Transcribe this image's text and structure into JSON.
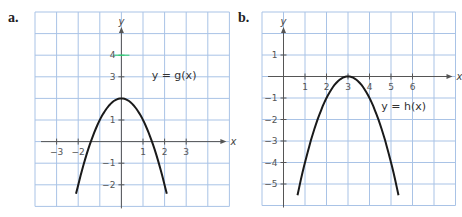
{
  "chart_data": [
    {
      "type": "line",
      "panel": "a.",
      "title": "",
      "function_label": "y = g(x)",
      "xlabel": "x",
      "ylabel": "y",
      "x_ticks": [
        -3,
        -2,
        1,
        2,
        3
      ],
      "x_tick_labels": [
        "−3",
        "−2",
        "1",
        "2",
        "3"
      ],
      "y_ticks": [
        4,
        3,
        1,
        -1,
        -2
      ],
      "y_tick_labels": [
        "4",
        "3",
        "1",
        "−1",
        "−2"
      ],
      "xlim": [
        -4,
        5
      ],
      "ylim": [
        -3,
        6
      ],
      "grid": true,
      "series": [
        {
          "name": "g(x)",
          "formula": "2 - x^2",
          "x": [
            -2.1,
            -2,
            -1.5,
            -1,
            -0.5,
            0,
            0.5,
            1,
            1.5,
            2,
            2.1
          ],
          "y": [
            -2.41,
            -2,
            -0.25,
            1,
            1.75,
            2,
            1.75,
            1,
            -0.25,
            -2,
            -2.41
          ]
        }
      ]
    },
    {
      "type": "line",
      "panel": "b.",
      "title": "",
      "function_label": "y = h(x)",
      "xlabel": "x",
      "ylabel": "y",
      "x_ticks": [
        1,
        2,
        3,
        4,
        5,
        6
      ],
      "x_tick_labels": [
        "1",
        "2",
        "3",
        "4",
        "5",
        "6"
      ],
      "y_ticks": [
        1,
        -1,
        -2,
        -3,
        -4,
        -5
      ],
      "y_tick_labels": [
        "1",
        "−1",
        "−2",
        "−3",
        "−4",
        "−5"
      ],
      "xlim": [
        -1,
        8
      ],
      "ylim": [
        -6,
        3
      ],
      "grid": true,
      "series": [
        {
          "name": "h(x)",
          "formula": "-(x - 3)^2",
          "x": [
            0.65,
            1,
            1.5,
            2,
            2.5,
            3,
            3.5,
            4,
            4.5,
            5,
            5.35
          ],
          "y": [
            -5.52,
            -4,
            -2.25,
            -1,
            -0.25,
            0,
            -0.25,
            -1,
            -2.25,
            -4,
            -5.52
          ]
        }
      ]
    }
  ],
  "colors": {
    "grid": "#a9c3e6",
    "axis": "#555555",
    "curve": "#1a1a1a",
    "highlight_tick": "#2ecc71"
  }
}
